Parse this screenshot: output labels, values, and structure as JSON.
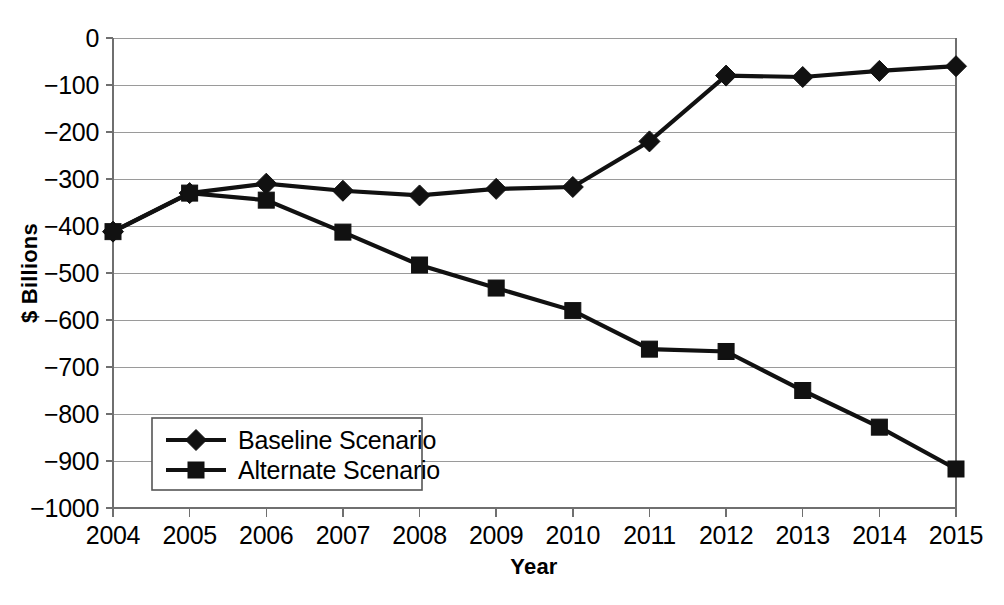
{
  "chart_data": {
    "type": "line",
    "title": "",
    "xlabel": "Year",
    "ylabel": "$ Billions",
    "categories": [
      "2004",
      "2005",
      "2006",
      "2007",
      "2008",
      "2009",
      "2010",
      "2011",
      "2012",
      "2013",
      "2014",
      "2015"
    ],
    "x": [
      2004,
      2005,
      2006,
      2007,
      2008,
      2009,
      2010,
      2011,
      2012,
      2013,
      2014,
      2015
    ],
    "series": [
      {
        "name": "Baseline Scenario",
        "marker": "diamond",
        "values": [
          -412,
          -330,
          -310,
          -325,
          -335,
          -321,
          -317,
          -220,
          -80,
          -83,
          -70,
          -60
        ]
      },
      {
        "name": "Alternate Scenario",
        "marker": "square",
        "values": [
          -412,
          -330,
          -345,
          -413,
          -483,
          -532,
          -580,
          -662,
          -667,
          -750,
          -828,
          -917
        ]
      }
    ],
    "ylim": [
      -1000,
      0
    ],
    "ytick_step": 100,
    "ytick_labels": [
      "0",
      "−100",
      "−200",
      "−300",
      "−400",
      "−500",
      "−600",
      "−700",
      "−800",
      "−900",
      "−1000"
    ],
    "ytick_values": [
      0,
      -100,
      -200,
      -300,
      -400,
      -500,
      -600,
      -700,
      -800,
      -900,
      -1000
    ],
    "grid": true,
    "grid_axis": "y",
    "legend_position": "bottom-left",
    "colors": {
      "series_line": "#111111",
      "marker": "#111111",
      "gridline": "#9a9a9a",
      "axis": "#6f6f6f",
      "background": "#ffffff",
      "text": "#000000"
    }
  }
}
